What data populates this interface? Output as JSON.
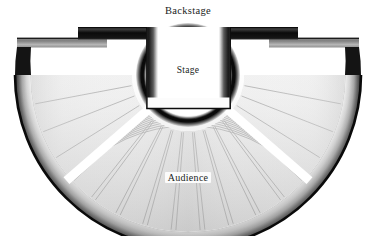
{
  "diagram": {
    "title_label": "Backstage",
    "stage_label": "Stage",
    "audience_label": "Audience",
    "type": "ancient-greek-theater-floor-plan",
    "colors": {
      "background": "#ffffff",
      "outer_rim_dark": "#1a1a1a",
      "rim_light": "#f2f2f2",
      "rim_mid": "#8a8a8a",
      "backstage_dark": "#111111",
      "backstage_mid": "#4a4a4a",
      "seat_line": "#9a9a9a",
      "text": "#211d1c"
    },
    "geometry": {
      "center_x": 188,
      "center_y": 75,
      "outer_radius": 173,
      "rim_inner_radius": 160,
      "seating_outer_radius": 157,
      "seating_inner_radius": 56,
      "orchestra_radius": 42,
      "orchestra_ring_outer": 49,
      "backstage_left": 78,
      "backstage_right": 298,
      "backstage_top": 27,
      "backstage_bottom": 39,
      "stage_left": 157,
      "stage_right": 220,
      "stage_bottom": 109,
      "stage_wall_thickness": 11
    },
    "sections": [
      {
        "name": "left-wedge",
        "tiers": 12,
        "tier_style": "radial"
      },
      {
        "name": "center-wedge",
        "tiers": 12,
        "tier_style": "concentric-arc"
      },
      {
        "name": "right-wedge",
        "tiers": 12,
        "tier_style": "radial"
      }
    ],
    "aisles": [
      {
        "name": "left-aisle",
        "angle_deg": 41
      },
      {
        "name": "right-aisle",
        "angle_deg": 139
      }
    ]
  }
}
